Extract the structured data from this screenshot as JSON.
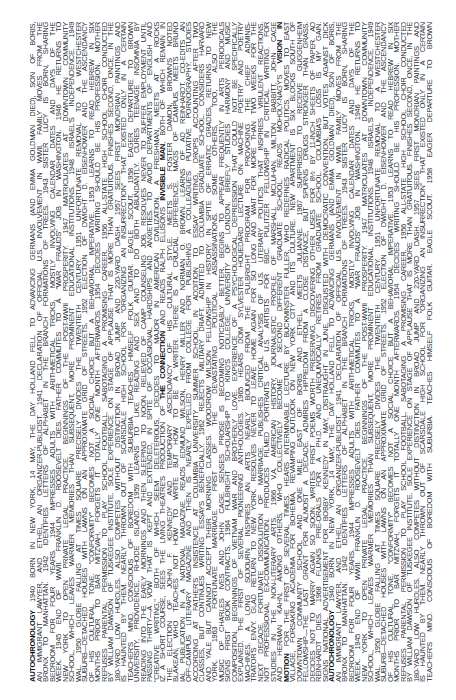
{
  "document": {
    "title": "AUTOCHRONOLOGY",
    "orientation": "rotated -90deg (reads bottom-to-top)",
    "text_color": "#2b2b2b",
    "background": "#ffffff",
    "highlighted_terms": [
      "AUTOCHRONOLOGY",
      "THE CONNECTION",
      "INVISIBLE MAN",
      "PASSIONS",
      "VISION IN",
      "MOTION"
    ],
    "lines": [
      [
        {
          "b": true,
          "t": "AUTOCHRONOLOGY"
        },
        {
          "t": "  1940  BORN IN NEW YORK, 14 MAY, THE DAY HOLLAND FELL TO ADVANCING GERMANS (AND EMMA GOLDMAN DIED), SON OF BORIS,"
        }
      ],
      [
        {
          "t": "AN IMMIGRANT LAWYER, AND ETHEL, AN ORGANIZER-PUBLICIST.  1941  DECLARATION OF OFFICIAL U.S. INVOLVEMENT IN WWII, FAMILY MOVES FROM THE"
        }
      ],
      [
        {
          "t": "BRONX TO MANHATTAN.  1942  IDENTIFIES LETTERS OF ALPHABET IN THE BRANCH FORMATIONS OF TREES.  1943  SISTER LUCY IS BORN, SHARING"
        }
      ],
      [
        {
          "t": "BEDROOM FOR FOUR YEARS.  1944  IMPRESSES ADULTS WITH ARITHMETICAL TRICKS, MOSTLY INVOLVING CALENDAR DATES AND DAYS OF THE"
        }
      ],
      [
        {
          "t": "WEEK.  1945  END OF WWII. FRANKLIN D. ROOSEVELT DIES. FATHER COMMUTES TO A \"WAR FRAUDS\" JOB IN WASHINGTON.  1946  HE RETURNS TO"
        }
      ],
      [
        {
          "t": "NEW YORK TO OPEN PRIVATE LEGAL PRACTICE. BEGINNINGS OF THE POST-WWII PROSPERITY.  1947  MATRICULATES AT DOWNTOWN COMMUNITY"
        }
      ],
      [
        {
          "t": "SCHOOL, WHICH LEAVES WARMER MEMORIES THAN SUBSEQUENT, MORE PROMINENT EDUCATIONAL INSTITUTIONS.  1948  ISRAEL'S INDEPENDENCE.  1949"
        }
      ],
      [
        {
          "t": "WAL.  1950  GLOBE FALLING AT TIMES SQUARE PRECISELY DIVIDES THE TWENTIETH CENTURY.  1951  UNFORTUNATE REMOVAL TO A WESTCHESTER"
        }
      ],
      [
        {
          "t": "SUBURB—DETACHED HOUSES WITH LAWNS ON AN APPROXIMATE GRID OF STREETS.  1952  ELECTION OF DWIGHT D. EISENHOWER AND THE ASCENDANCY"
        }
      ],
      [
        {
          "t": "OF HIS CULTURAL TONE. \"CONFORMITY\" BECOMES NOT A SOCIAL CHOICE BUT A BEHAVIORAL IMPERATIVE.  1953  LEARNS TO READ HEBREW IN SIX"
        }
      ],
      [
        {
          "t": "MONTHS PRIOR TO BAR MITZVAH, FORGETS IT TOTALLY ONE MONTH AFTERWARDS.  1954  DECIDES WRITING SHOULD BE HIS PROFESSION. MOTHER"
        }
      ],
      [
        {
          "t": "REFUSES PARENTAL PERMISSION TO PLAY SCHOOL FOOTBALL, SABOTAGING A PROMISING CAREER.  1956  ALL-STATE HIGH SCHOOL CHOIR CONDUCTED"
        }
      ],
      [
        {
          "t": "BY WILLIAM DAWSON OF TUSKEGEE INSTITUTE. SOLE EXPERIENCE ON STAGE OF APPLAUSE THAT IS MORE THAN GRATUITOUS. FINISHES SECOND, ONCE, IN THE"
        }
      ],
      [
        {
          "t": "180-YARD LOW HURDLES. ALSO COMPETES WITHOUT DISTINCTION IN BROAD JUMP AND 220-YARD DASH.  1957  SEES FIRST MONDRIAN PAINTINGS AND"
        }
      ],
      [
        {
          "t": "IS HAUNTED BY THEM. NEARLY THROWN OUT OF SCARSDALE HIGH SCHOOL FOR \"ORGANIZING AN INSURRECTION\" THAT EXISTED ONLY IN A CERTAIN"
        }
      ],
      [
        {
          "t": "TEACHER'S MIND. CONSCIOUS OF BOREDOM WITH SUBURBIA. TEACHES HIMSELF FOLK GUITAR. EAGLE SCOUT.  1958  EAGER DEPARTURE TO BROWN"
        }
      ],
      [
        {
          "t": "UNIVERSITY, PROVIDENCE, RHODE ISLAND.  1959  LEARNS TO LIKE READING AND SEX AND TO DO BOTH ABUNDANTLY. CURES TEENAGE INSOMNIA BY"
        }
      ],
      [
        {
          "t": "READING INTO THE EARLY MORNINGS AND THEN SLEEPING TO NOON. RELIEVED OF CAMP COUNSELING JOB. RESOLVES NEVER TO SUFFER EMPLOYMENT UNTIL"
        }
      ],
      [
        {
          "t": "PASSING THIRTY—A VOW THAT IS KEPT AND EXTENDED, IN SPITE OF OCCASIONAL HARDSHIPS AND ANXIETIES. TO AVOID DEPARTMENTS OF ENGLISH AND"
        }
      ],
      [
        {
          "t": "\"CREATIVE WRITING,\" BOTH OF WHICH SEEM DELETERIOUS, DECIDES TO MAJOR IN AMERICAN CIVILIZATION. A FRESHMAN, MEETS AT A ROCKS"
        }
      ],
      [
        {
          "t": "IZ A SHORT COURSE, SEES THE LIVING THEATRE'S PRODUCTION OF "
        },
        {
          "b": true,
          "t": "THE CONNECTION"
        },
        {
          "t": " AND READS RALPH ELLISON'S "
        },
        {
          "b": true,
          "t": "INVISIBLE MAN"
        },
        {
          "t": ", BOTH OF WHICH REMAIN IN"
        }
      ],
      [
        {
          "t": "THE ELECTION OF JOHN F. KENNEDY AND TEMPORARY ASCENDANCY OF HIS CULTURAL STYLE. MEETS S. FOSTER DAMON, BROWN'S NOTED"
        }
      ],
      [
        {
          "t": "BLAKEAN, WHO TEACHES NOT HOW TO WRITE BUT HOW TO BE A WRITER. THERE IS A CRUCIAL DIFFERENCE. MAGS OF CAMPUS. MEETS BRUNO"
        }
      ],
      [
        {
          "t": "IAL PUBLICATION IN A NATIONAL MAGAZINE. READS EDMUND WILSON, HENRY MILLER AND NORMAN O. BROWN. LEARNS OF AD REINHARDT. CO-EDITS AN"
        }
      ],
      [
        {
          "t": "OFF-CAMPUS LITERARY MAGAZINE AND THEN IS NEARLY EXPELLED FROM COLLEGE FOR PUBLISHING A COLLEAGUE'S PUTATIVE PORNOGRAPHY. STUDIES"
        }
      ],
      [
        {
          "t": "ACCORDING AT FATHER'S INSISTENCE AT COLUMBIA UNIVERSITY SUMMER SCHOOL. IN ADDITION TO ESSAY WRITING, DROPS ACCOUNTING AFTER TWO"
        }
      ],
      [
        {
          "t": "CLASSES, BUT CONTINUES WRITING ESSAYS BENEFICIALLY.  1962  REJECTS MILITARY DRAFT. ADMITTED TO COLUMBIA GRADUATE SCHOOL. CONSIDERS HARVARD"
        }
      ],
      [
        {
          "t": "AND YALE BUT CANNOT ACCEPT THEIR MORNING CLASSES. WOODROW WILSON FELLOWSHIP IN HISTORY. IN SPITE OF ERRATIC GRADES, RETURNS TO NEW"
        }
      ],
      [
        {
          "t": "YORK.  1963  FORTUNATE MARRIAGE. FIRST OF THE DEVASTATING POLITICAL ASSASSINATIONS. SOME OTHERS, TOO, ALSO THE"
        }
      ],
      [
        {
          "t": "MUSIC OF CHARLES IVES AND JOHN CAGE. SENSES PROSE IS BECOMING NOTICEABLY BETTER. BEGINS TO APPEAR FREQUENTLY IN ARTS PERIODICALS"
        }
      ],
      [
        {
          "t": "SIGNS FIRST BOOK CONTRACTS.  1964  FULBRIGHT SCHOLARSHIP TO KING'S COLLEGE, UNIVERSITY OF LONDON. BRIEFLY STUDIES HARMONY AND MUSIC"
        }
      ],
      [
        {
          "t": "COMPOSITION. BEGINNINGS OF VIETNAM WAR AND BROTHERLY LOVE. EXPERIENCE OF A PSYCHOLOGICAL DEPRESSION THAT COULD NOT BE SPECIFICALLY"
        }
      ],
      [
        {
          "t": "EXPLAINED. THE FIRST OF SEVERAL PIONEERING ANTHOLOGIES.  1965  HEARS DOM SYLVESTER HOUEDARD LECTURE ON MACHINE POETRY AND POETRY"
        }
      ],
      [
        {
          "t": "MACHINES. A LONG SOJOURN INSPIRES AN ARTS NEARLY BOUNCED FROM THE FULBRIGHT PROGRAM FOR PROVOKING THE CHIEF ADMINIS-"
        }
      ],
      [
        {
          "t": "TRATOR'S ENVY. GLAD RETURN TO NEW YORK. RESOLVES NEVER TO LEAVE HOME AGAIN FOR SO LONG AND WAIT FOR MORE THAN TWO WEEKS FOR THE"
        }
      ],
      [
        {
          "t": "NEXT DECADE. FORTUNATE DISSOLUTION OF MARRIAGE. PUBLISHES CRITICAL ANALYSIS OF U.S. LITERARY POLITICS THAT INSPIRES VIRULENT REACTIONS."
        }
      ],
      [
        {
          "t": "NOT PROFESSIONAL EX-COMMUNICATION. PRODUCES FILMED PORTRAITS OF U.S. ARTISTS FOR BBC. PULITZER FELLOWSHIP IN CRITICAL WRITING. FOR"
        }
      ],
      [
        {
          "t": "STUDIES IN THE NON-LITERARY ARTS.  1966  V.A. AMERICAN HISTORY, JOURNALISTIC PROFILE OF MARSHALL MCLUHAN. MILTON BABBITT, JOHN CAGE"
        }
      ],
      [
        {
          "t": "AND HERMAN KAHN, AMONG OTHERS, WHO COLLECTIVELY BECOME A SECOND DIFFERENT GRADUATE SCHOOL. READS MOHOLY-NAGY'S "
        },
        {
          "b": true,
          "t": "VISION IN"
        }
      ],
      [
        {
          "b": true,
          "t": "MOTION"
        },
        {
          "t": " FOR THE FIRST OF SEVERAL TIMES. HEARS INTERMINABLE LECTURE BY BUCKMINSTER FULLER, WHO REDEFINES RADICAL POLITICS. MOVES TO EAST"
        }
      ],
      [
        {
          "t": "VILLAGE, FORSAKING ACADEMIA FOR BOHEMIA, REVAMPING OUTLOOK ON NEW YORK CITY AND ITS CULTURE. NEW APARTMENT IS SIX BLOCKS SOUTH OF"
        }
      ],
      [
        {
          "t": "DOWNTOWN COMMUNITY SCHOOL AND ONE MILE EAST OF BORIS AND ETHEL. MEETS JULIANNE.  1967  SURPRISED TO RECEIVE GUGGENHEIM"
        }
      ],
      [
        {
          "t": "FELLOWSHIP—THE LAST GRANT FOR ALMOST A DECADE. ADMIRES HIPPIEDOM FROM A CLOSE DISTANCE, BUT SPURNS DRUGS STRONGER THAN GRASS."
        }
      ],
      [
        {
          "t": "DECIDES NOT TO MARRY AGAIN SO SOON. WRITES FIRST POEMS WORTH PRESERVING, DISCOVERING OTHER USES FOR 8½ BY 11-INCH SHEETS OF PAPER. AD"
        }
      ],
      [
        {
          "t": "REINHARDT DIES.  1968  FLUNKS PRE-ORALS FOR A PH.D. AND UNEQUIVOCALLY RETIRES FROM GRADUATE SCHOOL. COLUMBIA'S LOSS IS MY GAIN."
        }
      ],
      [
        {
          "t": "SIGNS NATIONAL ADVERTISEMENT FOR BOBBY KENNEDY IN MAY, DISTRAUGHT IN JUNE, DISGUSTED WITH DEMOCRATIC CONVENTION, BUT VOTES AGAINST DICK"
        }
      ]
    ]
  }
}
